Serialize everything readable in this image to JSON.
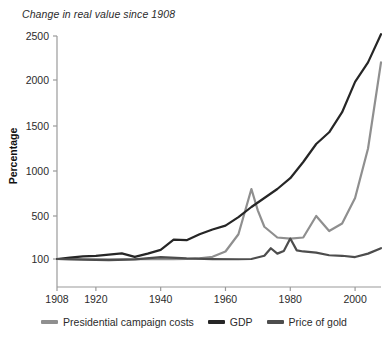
{
  "chart_data": {
    "type": "line",
    "title": "Change in real value since 1908",
    "xlabel": "",
    "ylabel": "Percentage",
    "xlim": [
      1908,
      2008
    ],
    "ylim": [
      60,
      2600
    ],
    "grid": false,
    "legend_position": "bottom",
    "yticks": [
      100,
      500,
      1000,
      1500,
      2000,
      2500
    ],
    "ytick_labels": [
      "100",
      "500",
      "1000",
      "1500",
      "2000",
      "2500"
    ],
    "xticks": [
      1908,
      1920,
      1940,
      1960,
      1980,
      2000
    ],
    "xtick_labels": [
      "1908",
      "1920",
      "1940",
      "1960",
      "1980",
      "2000"
    ],
    "note": "Vertical scale is compressed below 500; the 100 tick sits lower than linear spacing would place it.",
    "series": [
      {
        "name": "Presidential campaign costs",
        "color": "#8f8f8f",
        "x": [
          1908,
          1912,
          1916,
          1920,
          1924,
          1928,
          1932,
          1936,
          1940,
          1944,
          1948,
          1952,
          1956,
          1960,
          1964,
          1968,
          1970,
          1972,
          1976,
          1980,
          1984,
          1988,
          1992,
          1996,
          2000,
          2004,
          2008
        ],
        "values": [
          100,
          98,
          96,
          95,
          94,
          95,
          96,
          97,
          98,
          99,
          100,
          105,
          120,
          170,
          330,
          800,
          560,
          400,
          300,
          290,
          300,
          500,
          360,
          430,
          700,
          1250,
          2200
        ]
      },
      {
        "name": "GDP",
        "color": "#262626",
        "x": [
          1908,
          1912,
          1916,
          1920,
          1924,
          1928,
          1932,
          1936,
          1940,
          1944,
          1948,
          1952,
          1956,
          1960,
          1964,
          1968,
          1972,
          1976,
          1980,
          1984,
          1988,
          1992,
          1996,
          2000,
          2004,
          2008
        ],
        "values": [
          100,
          112,
          125,
          130,
          140,
          152,
          120,
          150,
          185,
          280,
          275,
          330,
          375,
          410,
          490,
          600,
          700,
          800,
          920,
          1100,
          1300,
          1430,
          1650,
          1980,
          2200,
          2520
        ]
      },
      {
        "name": "Price of gold",
        "color": "#4d4d4d",
        "x": [
          1908,
          1916,
          1924,
          1932,
          1940,
          1948,
          1956,
          1964,
          1968,
          1972,
          1974,
          1976,
          1978,
          1980,
          1982,
          1984,
          1988,
          1992,
          1996,
          2000,
          2004,
          2008
        ],
        "values": [
          100,
          88,
          80,
          95,
          118,
          105,
          98,
          96,
          100,
          130,
          200,
          150,
          175,
          290,
          180,
          170,
          160,
          135,
          130,
          118,
          150,
          200
        ]
      }
    ]
  },
  "legend": {
    "items": [
      {
        "label": "Presidential campaign costs",
        "color": "#8f8f8f"
      },
      {
        "label": "GDP",
        "color": "#262626"
      },
      {
        "label": "Price of gold",
        "color": "#4d4d4d"
      }
    ]
  }
}
